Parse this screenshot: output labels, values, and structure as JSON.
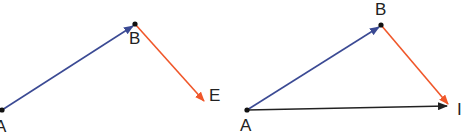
{
  "colors": {
    "vector_ab": "#3b4a94",
    "vector_be": "#f0572a",
    "vector_ae": "#222222",
    "point": "#111111",
    "label": "#222222"
  },
  "left_diagram": {
    "points": {
      "A": {
        "label": "A",
        "x": 2,
        "y": 110
      },
      "B": {
        "label": "B",
        "x": 135,
        "y": 24
      },
      "E": {
        "label": "E",
        "x": 204,
        "y": 101
      }
    },
    "vectors": [
      {
        "name": "AB",
        "from": "A",
        "to": "B",
        "color": "vector_ab"
      },
      {
        "name": "BE",
        "from": "B",
        "to": "E",
        "color": "vector_be"
      }
    ]
  },
  "right_diagram": {
    "points": {
      "A": {
        "label": "A",
        "x": 247,
        "y": 110
      },
      "B": {
        "label": "B",
        "x": 381,
        "y": 25
      },
      "E": {
        "label": "I",
        "x": 448,
        "y": 105
      }
    },
    "vectors": [
      {
        "name": "AB",
        "from": "A",
        "to": "B",
        "color": "vector_ab"
      },
      {
        "name": "BE",
        "from": "B",
        "to": "E",
        "color": "vector_be"
      },
      {
        "name": "AE",
        "from": "A",
        "to": "E",
        "color": "vector_ae"
      }
    ]
  }
}
